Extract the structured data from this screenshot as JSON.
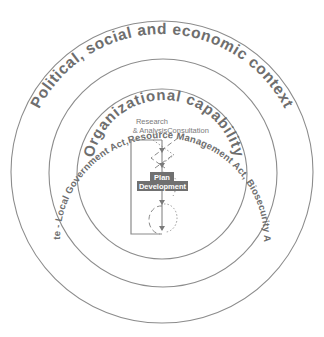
{
  "diagram": {
    "rings": [
      {
        "id": "outer",
        "label": "Political, social and economic context"
      },
      {
        "id": "middle",
        "label": "Mandate - Local Government Act,Resource Management Act, Biosecurity Act etc."
      },
      {
        "id": "inner",
        "label": "Organizational capability"
      }
    ],
    "process": {
      "research_label_line1": "Research",
      "research_label_line2": "& Analysis",
      "consultation_label": "Consultation",
      "plan_label_line1": "Plan",
      "plan_label_line2": "Development"
    },
    "colors": {
      "line": "#8c8c8c",
      "text": "#6e6e6e",
      "badge": "#707070",
      "background": "#ffffff"
    }
  }
}
